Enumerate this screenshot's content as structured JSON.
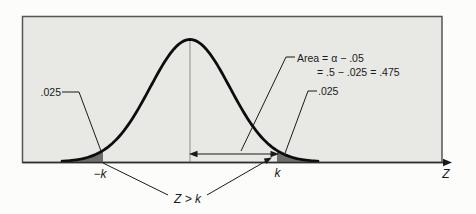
{
  "figure": {
    "colors": {
      "panel_fill": "#e8e8e5",
      "panel_stroke": "#555553",
      "axis_stroke": "#2e2e2c",
      "curve_color": "#0d0d0d",
      "shade_color": "#6e6e6b",
      "center_line": "#8c8c8c",
      "text_color": "#1a1a1a"
    },
    "labels": {
      "left_tail_area": ".025",
      "right_tail_area": ".025",
      "area_note_line1": "Area = α − .05",
      "area_note_line2": "= .5 − .025 = .475",
      "neg_k": "−k",
      "k": "k",
      "axis": "Z",
      "tail_event": "Z > k"
    },
    "curve": {
      "type": "normal-distribution",
      "center_x": 190,
      "sigma": 40,
      "peak_top_y": 39.5,
      "base_y": 162,
      "k_offset": 87,
      "x_min": 62,
      "x_max": 318
    }
  }
}
